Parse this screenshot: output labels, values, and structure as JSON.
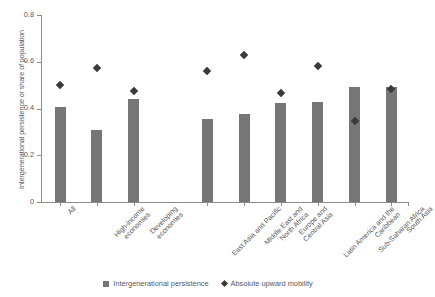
{
  "chart_data": {
    "type": "bar",
    "title": "",
    "xlabel": "",
    "ylabel": "Intergenerational persistence or share of population",
    "ylim": [
      0,
      0.8
    ],
    "yticks": [
      "0",
      "0.2",
      "0.4",
      "0.6",
      "0.8"
    ],
    "ytick_values": [
      0,
      0.2,
      0.4,
      0.6,
      0.8
    ],
    "grid": false,
    "legend_position": "bottom-center",
    "categories": [
      "All",
      "High-income economies",
      "Developing economies",
      "East Asia and Pacific",
      "Middle East and North Africa",
      "Europe and Central Asia",
      "Latin America and the Caribbean",
      "Sub-Saharan Africa",
      "South Asia"
    ],
    "category_lines": [
      [
        "All"
      ],
      [
        "High-income",
        "economies"
      ],
      [
        "Developing",
        "economies"
      ],
      [
        "East Asia and Pacific"
      ],
      [
        "Middle East and",
        "North Africa"
      ],
      [
        "Europe and",
        "Central Asia"
      ],
      [
        "Latin America and the",
        "Caribbean"
      ],
      [
        "Sub-Saharan Africa"
      ],
      [
        "South Asia"
      ]
    ],
    "series": [
      {
        "name": "Intergenerational persistence",
        "type": "bar",
        "color": "#767676",
        "values": [
          0.405,
          0.31,
          0.44,
          0.355,
          0.375,
          0.425,
          0.43,
          0.49,
          0.49
        ]
      },
      {
        "name": "Absolute upward mobility",
        "type": "scatter",
        "marker": "diamond",
        "color": "#3a3a3a",
        "values": [
          0.5,
          0.575,
          0.475,
          0.56,
          0.63,
          0.465,
          0.58,
          0.345,
          0.485
        ]
      }
    ]
  },
  "legend": {
    "items": [
      {
        "label": "Intergenerational persistence",
        "icon": "square-swatch"
      },
      {
        "label": "Absolute upward mobility",
        "icon": "diamond-swatch"
      }
    ]
  }
}
